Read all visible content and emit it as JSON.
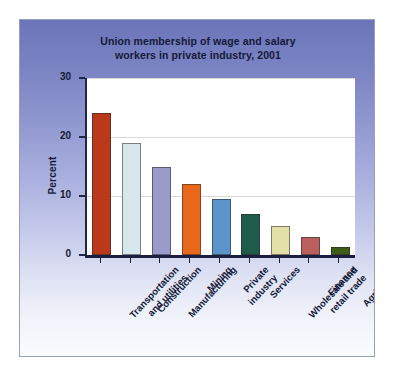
{
  "figure": {
    "title_lines": [
      "Union membership of wage and salary",
      "workers in private industry, 2001"
    ],
    "background_top_color": "#6b74b8",
    "background_bottom_color": "#fbfcfe",
    "border_color": "#9aa0b4",
    "plot_background": "#ffffff",
    "axis_color": "#22254a",
    "gridline_color": "#d8d8d8"
  },
  "chart_data": {
    "type": "bar",
    "xlabel": "",
    "ylabel": "Percent",
    "ylim": [
      0,
      30
    ],
    "yticks": [
      0,
      10,
      20,
      30
    ],
    "ytick_labels": [
      "0",
      "10",
      "20",
      "30"
    ],
    "grid": true,
    "grid_axis": "y",
    "legend": null,
    "legend_position": "none",
    "categories": [
      "Transportation and utilities",
      "Construction",
      "Manufacturing",
      "Mining",
      "Private industry",
      "Services",
      "Wholesale and retail trade",
      "Finance",
      "Agriculture"
    ],
    "category_label_lines": [
      [
        "Transportation",
        "and utilities"
      ],
      [
        "Construction"
      ],
      [
        "Manufacturing"
      ],
      [
        "Mining"
      ],
      [
        "Private",
        "industry"
      ],
      [
        "Services"
      ],
      [
        "Wholesale and",
        "retail trade"
      ],
      [
        "Finance"
      ],
      [
        "Agriculture"
      ]
    ],
    "values": [
      24,
      19,
      15,
      12,
      9.5,
      7,
      5,
      3,
      1.4
    ],
    "bar_colors": [
      "#b9391a",
      "#d8e7ee",
      "#9a9bcb",
      "#e8671a",
      "#5b94ca",
      "#1f5b4a",
      "#e3e1a8",
      "#b9605e",
      "#3d5c18"
    ],
    "units": "percent"
  }
}
